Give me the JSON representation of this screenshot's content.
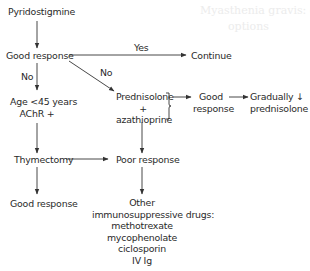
{
  "background_bleed": {
    "line1": "Myasthenia gravis: drug",
    "line2": "options"
  },
  "nodes": {
    "pyridostigmine": "Pyridostigmine",
    "good_response_1": "Good response",
    "continue": "Continue",
    "age_criteria": [
      "Age <45 years",
      "AChR +"
    ],
    "prednisolone_combo": [
      "Prednisolone",
      "+",
      "azathioprine"
    ],
    "good_response_2": [
      "Good",
      "response"
    ],
    "gradually_reduce": [
      "Gradually ↓",
      "prednisolone"
    ],
    "thymectomy": "Thymectomy",
    "poor_response": "Poor response",
    "good_response_3": "Good response",
    "other_drugs": {
      "title": [
        "Other",
        "immunosuppressive drugs:"
      ],
      "items": [
        "methotrexate",
        "mycophenolate",
        "ciclosporin",
        "IV Ig"
      ]
    }
  },
  "edge_labels": {
    "yes": "Yes",
    "no_down": "No",
    "no_diag": "No"
  },
  "colors": {
    "text": "#2a2a2a",
    "line": "#333333",
    "background": "#ffffff"
  }
}
